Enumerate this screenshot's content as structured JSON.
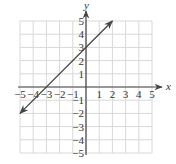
{
  "chart_data": {
    "type": "line",
    "title": "",
    "xlabel": "x",
    "ylabel": "y",
    "xlim": [
      -5,
      5
    ],
    "ylim": [
      -5,
      5
    ],
    "grid": true,
    "x_ticks": [
      "-5",
      "-4",
      "-3",
      "-2",
      "-1",
      "1",
      "2",
      "3",
      "4",
      "5"
    ],
    "y_ticks": [
      "5",
      "4",
      "3",
      "2",
      "1",
      "-1",
      "-2",
      "-3",
      "-4",
      "-5"
    ],
    "series": [
      {
        "name": "y = x + 3",
        "x": [
          -5,
          2
        ],
        "y": [
          -2,
          5
        ],
        "arrows_both_ends": true
      }
    ],
    "annotations": []
  },
  "colors": {
    "grid": "#d8d8d8",
    "axis": "#444444",
    "line": "#444444"
  }
}
